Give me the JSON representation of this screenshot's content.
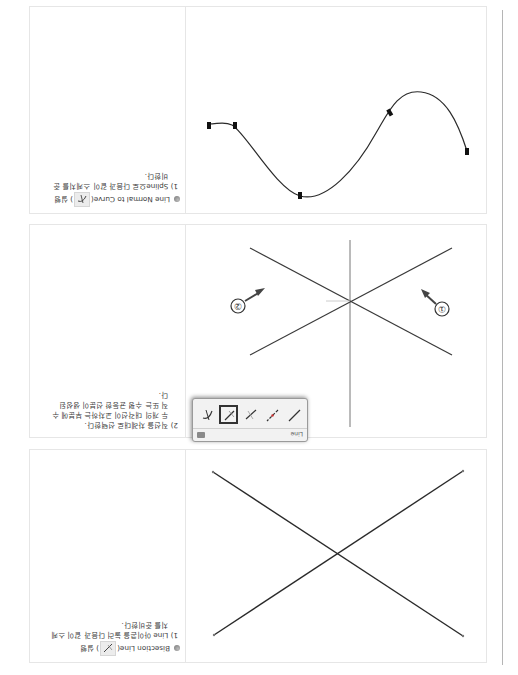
{
  "document": {
    "orientation": "rotated-180",
    "sections": [
      {
        "id": "bisection-line",
        "title": "Bisection Line(",
        "title_suffix": ") 실행",
        "icon": "bisection-line-icon",
        "steps": [
          {
            "label": "1) Line 아이콘을 눌러 다음과 같이 스케",
            "cont": "치를 준비한다."
          }
        ],
        "figure": {
          "type": "two-crossing-lines",
          "lines": [
            {
              "x1": 54,
              "y1": 38,
              "x2": 304,
              "y2": 202
            },
            {
              "x1": 54,
              "y1": 203,
              "x2": 303,
              "y2": 39
            }
          ]
        }
      },
      {
        "id": "bisection-line-step2",
        "steps": [
          {
            "label": "2) 직선을 차례대로 선택한다.",
            "cont": "두 개의 대각선이 교차하는 부분에 수",
            "cont2": "직 또는 수평 균등한 선분이 생성된",
            "cont3": "다."
          }
        ],
        "toolbar": {
          "title": "Line",
          "tools": [
            "line-icon",
            "centerline-icon",
            "bisection-line-icon",
            "normal-line-icon",
            "angle-line-icon"
          ],
          "selected_index": 3
        },
        "callouts": [
          {
            "label": "①",
            "target": "line-1"
          },
          {
            "label": "②",
            "target": "line-2"
          }
        ]
      },
      {
        "id": "line-normal-to-curve",
        "title": "Line Normal to Curve(",
        "title_suffix": ") 실행",
        "icon": "line-normal-to-curve-icon",
        "steps": [
          {
            "label": "1) Spline으로 다음과 같이 스케치를 준",
            "cont": "비한다."
          }
        ],
        "figure": {
          "type": "spline",
          "control_points": [
            [
              50,
              523
            ],
            [
              127,
              501
            ],
            [
              205,
              619
            ],
            [
              281,
              527
            ],
            [
              307,
              527
            ]
          ]
        }
      }
    ]
  }
}
